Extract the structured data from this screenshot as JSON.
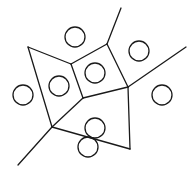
{
  "diagram": {
    "type": "voronoi",
    "stroke_color": "#1a1a1a",
    "background": "#ffffff",
    "vertices": {
      "v_left": [
        28,
        47
      ],
      "v_top_inner": [
        71,
        64
      ],
      "v_top": [
        107,
        44
      ],
      "v_right": [
        128,
        87
      ],
      "v_center": [
        83,
        98
      ],
      "v_bottom_left": [
        52,
        127
      ],
      "v_bottom_right": [
        130,
        149
      ]
    },
    "edges": [
      {
        "from": [
          28,
          47
        ],
        "to": [
          71,
          64
        ]
      },
      {
        "from": [
          71,
          64
        ],
        "to": [
          107,
          44
        ]
      },
      {
        "from": [
          107,
          44
        ],
        "to": [
          121,
          8
        ]
      },
      {
        "from": [
          107,
          44
        ],
        "to": [
          128,
          87
        ]
      },
      {
        "from": [
          128,
          87
        ],
        "to": [
          186,
          47
        ]
      },
      {
        "from": [
          71,
          64
        ],
        "to": [
          83,
          98
        ]
      },
      {
        "from": [
          83,
          98
        ],
        "to": [
          128,
          87
        ]
      },
      {
        "from": [
          28,
          47
        ],
        "to": [
          52,
          127
        ]
      },
      {
        "from": [
          83,
          98
        ],
        "to": [
          52,
          127
        ]
      },
      {
        "from": [
          52,
          127
        ],
        "to": [
          18,
          165
        ]
      },
      {
        "from": [
          52,
          127
        ],
        "to": [
          130,
          149
        ]
      },
      {
        "from": [
          128,
          87
        ],
        "to": [
          130,
          149
        ]
      }
    ],
    "sites": [
      {
        "cx": 75,
        "cy": 37,
        "r": 10
      },
      {
        "cx": 139,
        "cy": 51,
        "r": 10
      },
      {
        "cx": 95,
        "cy": 73,
        "r": 10
      },
      {
        "cx": 59,
        "cy": 86,
        "r": 10
      },
      {
        "cx": 23,
        "cy": 95,
        "r": 10
      },
      {
        "cx": 162,
        "cy": 95,
        "r": 10
      },
      {
        "cx": 95,
        "cy": 128,
        "r": 10
      },
      {
        "cx": 88,
        "cy": 147,
        "r": 10
      }
    ]
  }
}
